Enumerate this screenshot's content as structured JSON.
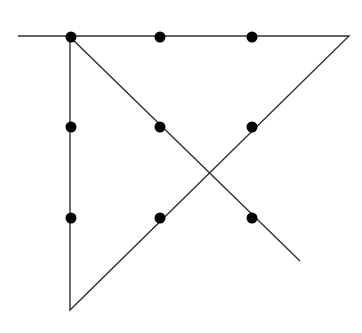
{
  "diagram": {
    "canvas": {
      "width": 362,
      "height": 333,
      "background": "#ffffff"
    },
    "line_color": "#333333",
    "dot_color": "#000000",
    "dot_radius": 5.5,
    "dots": [
      {
        "id": "r1c1",
        "x": 71,
        "y": 37
      },
      {
        "id": "r1c2",
        "x": 160,
        "y": 37
      },
      {
        "id": "r1c3",
        "x": 252,
        "y": 37
      },
      {
        "id": "r2c1",
        "x": 71,
        "y": 127
      },
      {
        "id": "r2c2",
        "x": 160,
        "y": 127
      },
      {
        "id": "r2c3",
        "x": 252,
        "y": 127
      },
      {
        "id": "r3c1",
        "x": 71,
        "y": 218
      },
      {
        "id": "r3c2",
        "x": 160,
        "y": 218
      },
      {
        "id": "r3c3",
        "x": 252,
        "y": 218
      }
    ],
    "path": [
      {
        "x": 18,
        "y": 36
      },
      {
        "x": 349,
        "y": 36
      },
      {
        "x": 70,
        "y": 310
      },
      {
        "x": 70,
        "y": 37
      },
      {
        "x": 300,
        "y": 261
      }
    ]
  }
}
